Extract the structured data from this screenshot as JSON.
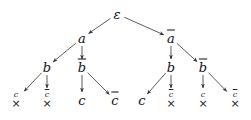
{
  "diagram": {
    "nodes": [
      {
        "id": "root",
        "label": "ε",
        "bar": false,
        "x": 117,
        "y": 14
      },
      {
        "id": "a",
        "label": "a",
        "bar": false,
        "x": 82,
        "y": 38
      },
      {
        "id": "abar",
        "label": "a",
        "bar": true,
        "x": 171,
        "y": 38
      },
      {
        "id": "a_b",
        "label": "b",
        "bar": false,
        "x": 47,
        "y": 67
      },
      {
        "id": "a_bbar",
        "label": "b",
        "bar": true,
        "x": 82,
        "y": 67
      },
      {
        "id": "abar_b",
        "label": "b",
        "bar": false,
        "x": 171,
        "y": 67
      },
      {
        "id": "abar_bbar",
        "label": "b",
        "bar": true,
        "x": 203,
        "y": 67
      },
      {
        "id": "a_bbar_c",
        "label": "c",
        "bar": false,
        "x": 82,
        "y": 100
      },
      {
        "id": "a_bbar_cbar",
        "label": "c",
        "bar": true,
        "x": 115,
        "y": 100
      },
      {
        "id": "abar_b_c",
        "label": "c",
        "bar": false,
        "x": 142,
        "y": 100
      }
    ],
    "failed_leaves": [
      {
        "id": "a_b_c",
        "label": "c",
        "bar": false,
        "x": 16,
        "y": 100
      },
      {
        "id": "a_b_cbar",
        "label": "c",
        "bar": true,
        "x": 47,
        "y": 100
      },
      {
        "id": "abar_b_cbar",
        "label": "c",
        "bar": true,
        "x": 171,
        "y": 100
      },
      {
        "id": "abar_bbar_c",
        "label": "c",
        "bar": false,
        "x": 203,
        "y": 100
      },
      {
        "id": "abar_bbar_cbar",
        "label": "c",
        "bar": true,
        "x": 235,
        "y": 100
      }
    ],
    "cross_symbol": "×",
    "edges": [
      [
        "root",
        "a"
      ],
      [
        "root",
        "abar"
      ],
      [
        "a",
        "a_b"
      ],
      [
        "a",
        "a_bbar"
      ],
      [
        "abar",
        "abar_b"
      ],
      [
        "abar",
        "abar_bbar"
      ],
      [
        "a_b",
        "a_b_c"
      ],
      [
        "a_b",
        "a_b_cbar"
      ],
      [
        "a_bbar",
        "a_bbar_c"
      ],
      [
        "a_bbar",
        "a_bbar_cbar"
      ],
      [
        "abar_b",
        "abar_b_c"
      ],
      [
        "abar_b",
        "abar_b_cbar"
      ],
      [
        "abar_bbar",
        "abar_bbar_c"
      ],
      [
        "abar_bbar",
        "abar_bbar_cbar"
      ]
    ],
    "edge_color": "#333333"
  }
}
